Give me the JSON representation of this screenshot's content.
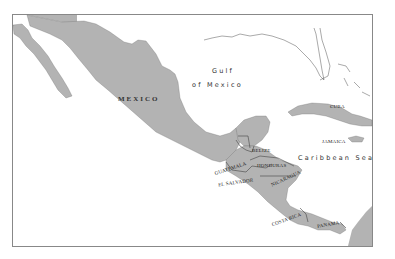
{
  "map": {
    "title": "",
    "colors": {
      "land": "#b3b3b3",
      "border": "#555555",
      "water": "#ffffff",
      "frame": "#888888"
    },
    "labels": {
      "mexico": "MEXICO",
      "gulf_line1": "Gulf",
      "gulf_line2": "of Mexico",
      "cuba": "CUBA",
      "jamaica": "JAMAICA",
      "caribbean": "Caribbean Sea",
      "belize": "BELIZE",
      "guatemala": "GUATEMALA",
      "honduras": "HONDURAS",
      "el_salvador": "EL SALVADOR",
      "nicaragua": "NICARAGUA",
      "costa_rica": "COSTA RICA",
      "panama": "PANAMA"
    }
  }
}
